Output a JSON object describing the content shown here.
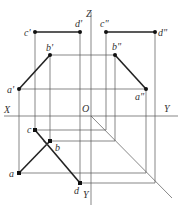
{
  "diagram": {
    "axes": {
      "X": "X",
      "Y_right": "Y",
      "Y_bottom": "Y",
      "Z": "Z",
      "origin": "O"
    },
    "front_view": {
      "a": "a'",
      "b": "b'",
      "c": "c'",
      "d": "d'"
    },
    "side_view": {
      "a": "a\"",
      "b": "b\"",
      "c": "c\"",
      "d": "d\""
    },
    "top_view": {
      "a": "a",
      "b": "b",
      "c": "c",
      "d": "d"
    },
    "colors": {
      "line": "#222222",
      "construction": "#555555"
    }
  }
}
